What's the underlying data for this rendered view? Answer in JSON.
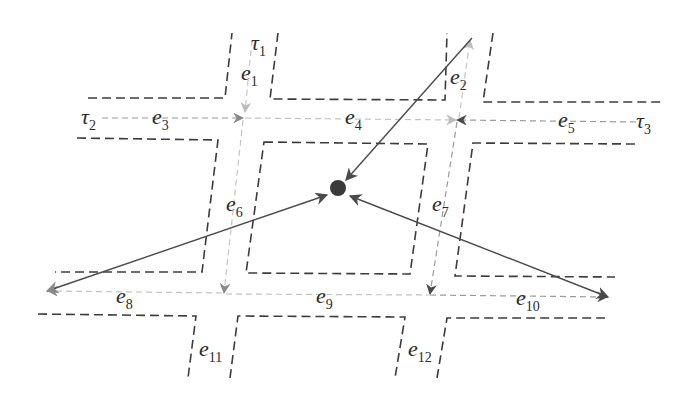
{
  "diagram": {
    "title": "",
    "colors": {
      "road_boundary": "#3c3c3c",
      "edge_light": "#c4c4c4",
      "edge_mid": "#9a9a9a",
      "trajectory": "#4a4a4a",
      "node": "#3a3a3a"
    },
    "trajectories": [
      {
        "id": "tau1",
        "symbol": "τ",
        "subscript": "1"
      },
      {
        "id": "tau2",
        "symbol": "τ",
        "subscript": "2"
      },
      {
        "id": "tau3",
        "symbol": "τ",
        "subscript": "3"
      }
    ],
    "edges": [
      {
        "id": "e1",
        "symbol": "e",
        "subscript": "1"
      },
      {
        "id": "e2",
        "symbol": "e",
        "subscript": "2"
      },
      {
        "id": "e3",
        "symbol": "e",
        "subscript": "3"
      },
      {
        "id": "e4",
        "symbol": "e",
        "subscript": "4"
      },
      {
        "id": "e5",
        "symbol": "e",
        "subscript": "5"
      },
      {
        "id": "e6",
        "symbol": "e",
        "subscript": "6"
      },
      {
        "id": "e7",
        "symbol": "e",
        "subscript": "7"
      },
      {
        "id": "e8",
        "symbol": "e",
        "subscript": "8"
      },
      {
        "id": "e9",
        "symbol": "e",
        "subscript": "9"
      },
      {
        "id": "e10",
        "symbol": "e",
        "subscript": "10"
      },
      {
        "id": "e11",
        "symbol": "e",
        "subscript": "11"
      },
      {
        "id": "e12",
        "symbol": "e",
        "subscript": "12"
      }
    ],
    "center_node": {
      "label": ""
    }
  }
}
